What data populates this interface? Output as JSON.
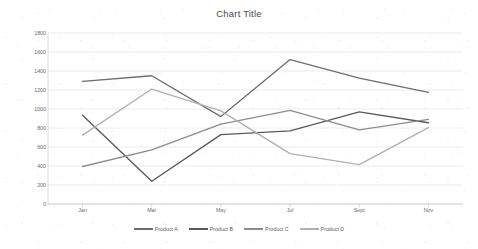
{
  "chart_data": {
    "type": "line",
    "title": "Chart Title",
    "xlabel": "",
    "ylabel": "",
    "categories": [
      "Jan",
      "Mar",
      "May",
      "Jul",
      "Sept",
      "Nov"
    ],
    "yticks": [
      0,
      200,
      400,
      600,
      800,
      1000,
      1200,
      1400,
      1600,
      1800
    ],
    "ylim": [
      0,
      1800
    ],
    "grid": true,
    "legend_position": "bottom",
    "series": [
      {
        "name": "Product A",
        "color": "#6e6e6e",
        "values": [
          1290,
          1350,
          920,
          1520,
          1325,
          1175
        ]
      },
      {
        "name": "Product B",
        "color": "#595959",
        "values": [
          935,
          240,
          730,
          770,
          970,
          855
        ]
      },
      {
        "name": "Product C",
        "color": "#8c8c8c",
        "values": [
          395,
          570,
          840,
          985,
          780,
          890
        ]
      },
      {
        "name": "Product D",
        "color": "#b0b0b0",
        "values": [
          725,
          1210,
          980,
          530,
          415,
          805
        ]
      }
    ]
  }
}
